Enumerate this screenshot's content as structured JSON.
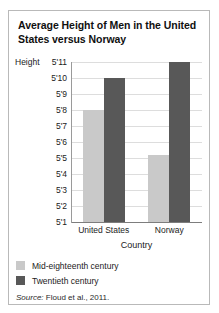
{
  "figure": {
    "title": "Average Height of Men in the United States versus Norway",
    "source_word": "Source:",
    "source_text": "Floud et al., 2011."
  },
  "chart_data": {
    "type": "bar",
    "title": "Average Height of Men in the United States versus Norway",
    "xlabel": "Country",
    "ylabel": "Height",
    "categories": [
      "United States",
      "Norway"
    ],
    "series": [
      {
        "name": "Mid-eighteenth century",
        "color": "#c9c9c9",
        "values": [
          5.6667,
          5.4333
        ],
        "value_labels": [
          "5'8",
          "5'5"
        ]
      },
      {
        "name": "Twentieth century",
        "color": "#585858",
        "values": [
          5.8333,
          5.9167
        ],
        "value_labels": [
          "5'10",
          "5'11"
        ]
      }
    ],
    "ylim": [
      5.0833,
      5.9167
    ],
    "ytick_labels": [
      "5'11",
      "5'10",
      "5'9",
      "5'8",
      "5'7",
      "5'6",
      "5'5",
      "5'4",
      "5'3",
      "5'2",
      "5'1"
    ],
    "ytick_values": [
      5.9167,
      5.8333,
      5.75,
      5.6667,
      5.5833,
      5.5,
      5.4167,
      5.3333,
      5.25,
      5.1667,
      5.0833
    ],
    "grid": true,
    "legend_position": "below-axis-left"
  }
}
